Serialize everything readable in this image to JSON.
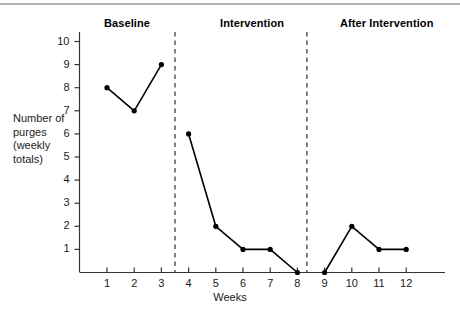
{
  "figure": {
    "phases": [
      {
        "id": "baseline",
        "label": "Baseline"
      },
      {
        "id": "intervention",
        "label": "Intervention"
      },
      {
        "id": "after",
        "label": "After Intervention"
      }
    ],
    "y_axis_title": "Number of purges (weekly totals)",
    "x_axis_title": "Weeks"
  },
  "chart_data": {
    "type": "line",
    "title": "",
    "xlabel": "Weeks",
    "ylabel": "Number of purges (weekly totals)",
    "xlim": [
      0,
      13
    ],
    "ylim": [
      0,
      10.6
    ],
    "xticks": [
      1,
      2,
      3,
      4,
      5,
      6,
      7,
      8,
      9,
      10,
      11,
      12
    ],
    "xtick_labels": [
      "1",
      "2",
      "3",
      "4",
      "5",
      "6",
      "7",
      "8",
      "9",
      "10",
      "11",
      "12"
    ],
    "yticks": [
      1,
      2,
      3,
      4,
      5,
      6,
      7,
      8,
      9,
      10
    ],
    "ytick_labels": [
      "1",
      "2",
      "3",
      "4",
      "5",
      "6",
      "7",
      "8",
      "9",
      "10"
    ],
    "grid": false,
    "legend": false,
    "x": [
      1,
      2,
      3,
      4,
      5,
      6,
      7,
      8,
      9,
      10,
      11,
      12
    ],
    "values": [
      8,
      7,
      9,
      6,
      2,
      1,
      1,
      0,
      0,
      2,
      1,
      1
    ],
    "series": [
      {
        "name": "Baseline",
        "x": [
          1,
          2,
          3
        ],
        "values": [
          8,
          7,
          9
        ]
      },
      {
        "name": "Intervention",
        "x": [
          4,
          5,
          6,
          7,
          8
        ],
        "values": [
          6,
          2,
          1,
          1,
          0
        ]
      },
      {
        "name": "After Intervention",
        "x": [
          9,
          10,
          11,
          12
        ],
        "values": [
          0,
          2,
          1,
          1
        ]
      }
    ],
    "phase_dividers": [
      3.5,
      8.35
    ],
    "annotations": [
      {
        "text": "Baseline",
        "x": 2.0,
        "position": "top"
      },
      {
        "text": "Intervention",
        "x": 6.0,
        "position": "top"
      },
      {
        "text": "After Intervention",
        "x": 10.8,
        "position": "top"
      }
    ],
    "marker": "filled-circle",
    "line_color": "#000000",
    "marker_color": "#000000"
  }
}
